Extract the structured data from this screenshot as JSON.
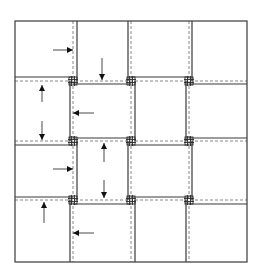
{
  "diagram": {
    "title": "",
    "type": "grid-displacement-diagram",
    "grid": {
      "rows": 4,
      "cols": 4
    },
    "frame": {
      "x1": 15,
      "y1": 21,
      "x2": 247,
      "y2": 262
    },
    "dashed_lines": {
      "vertical_x": [
        73,
        131,
        189
      ],
      "horizontal_y": [
        81,
        141,
        200
      ]
    },
    "solid_segments": [
      {
        "x1": 77,
        "y1": 21,
        "x2": 77,
        "y2": 81
      },
      {
        "x1": 128,
        "y1": 21,
        "x2": 128,
        "y2": 81
      },
      {
        "x1": 192,
        "y1": 21,
        "x2": 192,
        "y2": 81
      },
      {
        "x1": 70,
        "y1": 81,
        "x2": 70,
        "y2": 141
      },
      {
        "x1": 135,
        "y1": 81,
        "x2": 135,
        "y2": 141
      },
      {
        "x1": 186,
        "y1": 81,
        "x2": 186,
        "y2": 141
      },
      {
        "x1": 77,
        "y1": 141,
        "x2": 77,
        "y2": 200
      },
      {
        "x1": 128,
        "y1": 141,
        "x2": 128,
        "y2": 200
      },
      {
        "x1": 192,
        "y1": 141,
        "x2": 192,
        "y2": 200
      },
      {
        "x1": 70,
        "y1": 200,
        "x2": 70,
        "y2": 262
      },
      {
        "x1": 135,
        "y1": 200,
        "x2": 135,
        "y2": 262
      },
      {
        "x1": 186,
        "y1": 200,
        "x2": 186,
        "y2": 262
      },
      {
        "x1": 15,
        "y1": 77,
        "x2": 73,
        "y2": 77
      },
      {
        "x1": 73,
        "y1": 84,
        "x2": 131,
        "y2": 84
      },
      {
        "x1": 131,
        "y1": 77,
        "x2": 189,
        "y2": 77
      },
      {
        "x1": 189,
        "y1": 84,
        "x2": 247,
        "y2": 84
      },
      {
        "x1": 15,
        "y1": 145,
        "x2": 73,
        "y2": 145
      },
      {
        "x1": 73,
        "y1": 138,
        "x2": 131,
        "y2": 138
      },
      {
        "x1": 131,
        "y1": 145,
        "x2": 189,
        "y2": 145
      },
      {
        "x1": 189,
        "y1": 138,
        "x2": 247,
        "y2": 138
      },
      {
        "x1": 15,
        "y1": 197,
        "x2": 73,
        "y2": 197
      },
      {
        "x1": 73,
        "y1": 204,
        "x2": 131,
        "y2": 204
      },
      {
        "x1": 131,
        "y1": 197,
        "x2": 189,
        "y2": 197
      },
      {
        "x1": 189,
        "y1": 204,
        "x2": 247,
        "y2": 204
      }
    ],
    "junctions": [
      {
        "x": 73,
        "y": 81
      },
      {
        "x": 131,
        "y": 81
      },
      {
        "x": 189,
        "y": 81
      },
      {
        "x": 73,
        "y": 141
      },
      {
        "x": 131,
        "y": 141
      },
      {
        "x": 189,
        "y": 141
      },
      {
        "x": 73,
        "y": 200
      },
      {
        "x": 131,
        "y": 200
      },
      {
        "x": 189,
        "y": 200
      }
    ],
    "arrows": [
      {
        "id": "r1c1-right",
        "direction": "right",
        "x1": 53,
        "y1": 50,
        "x2": 73,
        "y2": 50
      },
      {
        "id": "r1c2-down",
        "direction": "down",
        "x1": 102,
        "y1": 58,
        "x2": 102,
        "y2": 80
      },
      {
        "id": "r2c1-up",
        "direction": "up",
        "x1": 42,
        "y1": 102,
        "x2": 42,
        "y2": 85
      },
      {
        "id": "r2c1-down",
        "direction": "down",
        "x1": 42,
        "y1": 121,
        "x2": 42,
        "y2": 140
      },
      {
        "id": "r2c2-left",
        "direction": "left",
        "x1": 94,
        "y1": 113,
        "x2": 73,
        "y2": 113
      },
      {
        "id": "r3c1-right",
        "direction": "right",
        "x1": 53,
        "y1": 169,
        "x2": 73,
        "y2": 169
      },
      {
        "id": "r3c2-up",
        "direction": "up",
        "x1": 104,
        "y1": 162,
        "x2": 104,
        "y2": 143
      },
      {
        "id": "r3c2-down",
        "direction": "down",
        "x1": 104,
        "y1": 180,
        "x2": 104,
        "y2": 198
      },
      {
        "id": "r4c1-up",
        "direction": "up",
        "x1": 44,
        "y1": 223,
        "x2": 44,
        "y2": 202
      },
      {
        "id": "r4c2-left",
        "direction": "left",
        "x1": 94,
        "y1": 233,
        "x2": 73,
        "y2": 233
      }
    ],
    "colors": {
      "solid_line": "#3a3a3a",
      "dashed_line": "#7a7a7a",
      "arrow": "#333333",
      "background": "#ffffff"
    }
  }
}
